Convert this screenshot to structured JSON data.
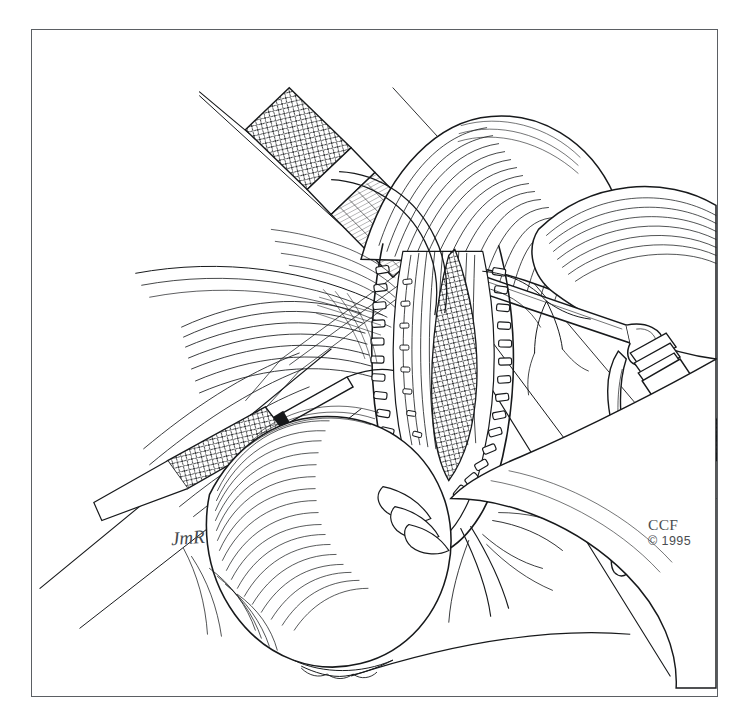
{
  "figure": {
    "medium": "pen-and-ink line drawing",
    "background_color": "#ffffff",
    "ink_color": "#17191b",
    "frame": {
      "border_color": "#5b5f63",
      "left": 31,
      "top": 29,
      "width": 687,
      "height": 668
    }
  },
  "credit": {
    "mark": "CCF",
    "copyright": "© 1995"
  },
  "signature": {
    "initials": "JmR"
  },
  "scene": {
    "description": "Open operative field showing a longitudinal incision closed along both margins with surgical staples, surrounding organ retracted and held by three knurled-handle clamps, with branching vasculature and fan-shaped mesenteric folds.",
    "elements": [
      {
        "name": "upper-left-clamp",
        "label": "Knurled surgical clamp, upper left"
      },
      {
        "name": "left-clamp",
        "label": "Knurled surgical clamp, mid left"
      },
      {
        "name": "right-clamp",
        "label": "Knurled surgical clamp, right"
      },
      {
        "name": "stapled-incision",
        "label": "Stapled incision line"
      },
      {
        "name": "retracted-organ",
        "label": "Retracted organ mass"
      },
      {
        "name": "vascular-branches",
        "label": "Branching blood vessels"
      },
      {
        "name": "mesenteric-fan",
        "label": "Fan-shaped mesenteric fold"
      },
      {
        "name": "retraction-sutures",
        "label": "Retraction suture threads"
      }
    ]
  }
}
